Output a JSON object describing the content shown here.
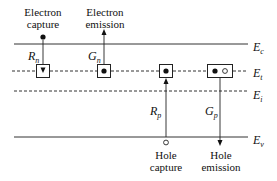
{
  "diagram": {
    "levels": [
      {
        "id": "Ec",
        "symbol": "E",
        "subscript": "c",
        "style": "solid"
      },
      {
        "id": "Et",
        "symbol": "E",
        "subscript": "t",
        "style": "dashed"
      },
      {
        "id": "Ei",
        "symbol": "E",
        "subscript": "i",
        "style": "dashed"
      },
      {
        "id": "Ev",
        "symbol": "E",
        "subscript": "v",
        "style": "solid"
      }
    ],
    "processes": [
      {
        "id": "electron-capture",
        "label_line1": "Electron",
        "label_line2": "capture",
        "rate_symbol": "R",
        "rate_subscript": "n",
        "direction": "down",
        "trap_content": "empty-with-arrow"
      },
      {
        "id": "electron-emission",
        "label_line1": "Electron",
        "label_line2": "emission",
        "rate_symbol": "G",
        "rate_subscript": "n",
        "direction": "up",
        "trap_content": "electron"
      },
      {
        "id": "hole-capture",
        "label_line1": "Hole",
        "label_line2": "capture",
        "rate_symbol": "R",
        "rate_subscript": "p",
        "direction": "up",
        "trap_content": "electron"
      },
      {
        "id": "hole-emission",
        "label_line1": "Hole",
        "label_line2": "emission",
        "rate_symbol": "G",
        "rate_subscript": "p",
        "direction": "down",
        "trap_content": "electron-and-hole"
      }
    ],
    "colors": {
      "line": "#222222",
      "background": "#ffffff"
    }
  }
}
